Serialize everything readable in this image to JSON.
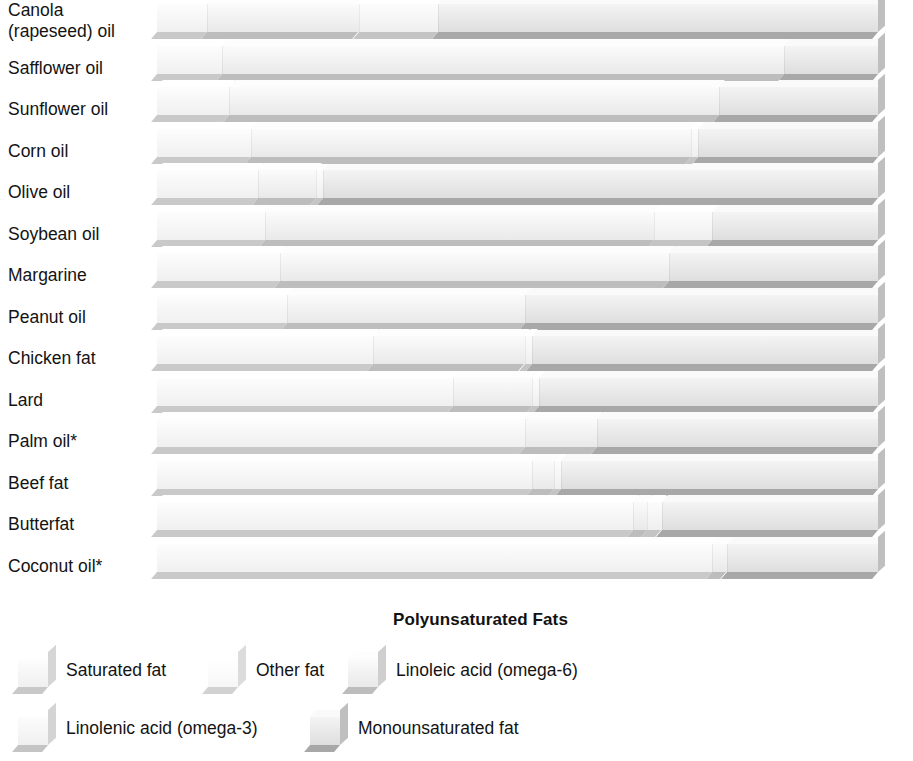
{
  "chart_data": {
    "type": "bar",
    "subtype": "stacked-horizontal-3d",
    "title": "",
    "xlabel": "",
    "ylabel": "",
    "xlim": [
      0,
      100
    ],
    "grid": false,
    "legend_position": "bottom-left",
    "units": "percent of total fat",
    "group_header": "Polyunsaturated Fats",
    "categories": [
      "Canola (rapeseed) oil",
      "Safflower oil",
      "Sunflower oil",
      "Corn oil",
      "Olive oil",
      "Soybean oil",
      "Margarine",
      "Peanut oil",
      "Chicken fat",
      "Lard",
      "Palm oil*",
      "Beef fat",
      "Butterfat",
      "Coconut oil*"
    ],
    "series": [
      {
        "name": "Saturated fat",
        "key": "saturated",
        "values": [
          7,
          9,
          10,
          13,
          14,
          15,
          17,
          18,
          30,
          41,
          51,
          52,
          66,
          77
        ]
      },
      {
        "name": "Other fat",
        "key": "other",
        "values": [
          0,
          0,
          0,
          0,
          0,
          0,
          0,
          0,
          0,
          0,
          0,
          0,
          0,
          0
        ]
      },
      {
        "name": "Linoleic acid (omega-6)",
        "key": "linoleic",
        "values": [
          21,
          78,
          68,
          61,
          8,
          54,
          54,
          33,
          21,
          11,
          10,
          3,
          2,
          2
        ]
      },
      {
        "name": "Linolenic acid (omega-3)",
        "key": "linolenic",
        "values": [
          11,
          0,
          0,
          1,
          1,
          8,
          0,
          0,
          1,
          1,
          0,
          1,
          2,
          0
        ]
      },
      {
        "name": "Monounsaturated fat",
        "key": "monounsat",
        "values": [
          61,
          13,
          22,
          25,
          77,
          23,
          29,
          49,
          48,
          47,
          39,
          44,
          30,
          21
        ]
      }
    ]
  },
  "rows": [
    {
      "label": "Canola\n(rapeseed) oil",
      "label_line1": "Canola",
      "label_line2": "(rapeseed) oil",
      "segments": [
        {
          "key": "saturated",
          "pct": 7
        },
        {
          "key": "linoleic",
          "pct": 21
        },
        {
          "key": "linolenic",
          "pct": 11
        },
        {
          "key": "monounsat",
          "pct": 61
        }
      ]
    },
    {
      "label": "Safflower oil",
      "segments": [
        {
          "key": "saturated",
          "pct": 9
        },
        {
          "key": "linoleic",
          "pct": 78
        },
        {
          "key": "monounsat",
          "pct": 13
        }
      ]
    },
    {
      "label": "Sunflower oil",
      "segments": [
        {
          "key": "saturated",
          "pct": 10
        },
        {
          "key": "linoleic",
          "pct": 68
        },
        {
          "key": "monounsat",
          "pct": 22
        }
      ]
    },
    {
      "label": "Corn oil",
      "segments": [
        {
          "key": "saturated",
          "pct": 13
        },
        {
          "key": "linoleic",
          "pct": 61
        },
        {
          "key": "linolenic",
          "pct": 1
        },
        {
          "key": "monounsat",
          "pct": 25
        }
      ]
    },
    {
      "label": "Olive oil",
      "segments": [
        {
          "key": "saturated",
          "pct": 14
        },
        {
          "key": "linoleic",
          "pct": 8
        },
        {
          "key": "linolenic",
          "pct": 1
        },
        {
          "key": "monounsat",
          "pct": 77
        }
      ]
    },
    {
      "label": "Soybean oil",
      "segments": [
        {
          "key": "saturated",
          "pct": 15
        },
        {
          "key": "linoleic",
          "pct": 54
        },
        {
          "key": "linolenic",
          "pct": 8
        },
        {
          "key": "monounsat",
          "pct": 23
        }
      ]
    },
    {
      "label": "Margarine",
      "segments": [
        {
          "key": "saturated",
          "pct": 17
        },
        {
          "key": "linoleic",
          "pct": 54
        },
        {
          "key": "monounsat",
          "pct": 29
        }
      ]
    },
    {
      "label": "Peanut oil",
      "segments": [
        {
          "key": "saturated",
          "pct": 18
        },
        {
          "key": "linoleic",
          "pct": 33
        },
        {
          "key": "monounsat",
          "pct": 49
        }
      ]
    },
    {
      "label": "Chicken fat",
      "segments": [
        {
          "key": "saturated",
          "pct": 30
        },
        {
          "key": "linoleic",
          "pct": 21
        },
        {
          "key": "linolenic",
          "pct": 1
        },
        {
          "key": "monounsat",
          "pct": 48
        }
      ]
    },
    {
      "label": "Lard",
      "segments": [
        {
          "key": "saturated",
          "pct": 41
        },
        {
          "key": "linoleic",
          "pct": 11
        },
        {
          "key": "linolenic",
          "pct": 1
        },
        {
          "key": "monounsat",
          "pct": 47
        }
      ]
    },
    {
      "label": "Palm oil*",
      "segments": [
        {
          "key": "saturated",
          "pct": 51
        },
        {
          "key": "linoleic",
          "pct": 10
        },
        {
          "key": "monounsat",
          "pct": 39
        }
      ]
    },
    {
      "label": "Beef fat",
      "segments": [
        {
          "key": "saturated",
          "pct": 52
        },
        {
          "key": "linoleic",
          "pct": 3
        },
        {
          "key": "linolenic",
          "pct": 1
        },
        {
          "key": "monounsat",
          "pct": 44
        }
      ]
    },
    {
      "label": "Butterfat",
      "segments": [
        {
          "key": "saturated",
          "pct": 66
        },
        {
          "key": "linoleic",
          "pct": 2
        },
        {
          "key": "linolenic",
          "pct": 2
        },
        {
          "key": "monounsat",
          "pct": 30
        }
      ]
    },
    {
      "label": "Coconut oil*",
      "segments": [
        {
          "key": "saturated",
          "pct": 77
        },
        {
          "key": "linoleic",
          "pct": 2
        },
        {
          "key": "monounsat",
          "pct": 21
        }
      ]
    }
  ],
  "poly_header": "Polyunsaturated Fats",
  "legend": {
    "row1": [
      {
        "key": "saturated",
        "label": "Saturated fat"
      },
      {
        "key": "other",
        "label": "Other fat"
      },
      {
        "key": "linoleic",
        "label": "Linoleic acid (omega-6)"
      }
    ],
    "row2": [
      {
        "key": "linolenic",
        "label": "Linolenic acid (omega-3)"
      },
      {
        "key": "monounsat",
        "label": "Monounsaturated fat"
      }
    ]
  },
  "colors": {
    "saturated": "#f5f5f5",
    "other": "#fbfbfb",
    "linoleic": "#efefef",
    "linolenic": "#f4f4f4",
    "monounsat": "#e6e6e6",
    "background": "#ffffff",
    "text": "#131313"
  }
}
